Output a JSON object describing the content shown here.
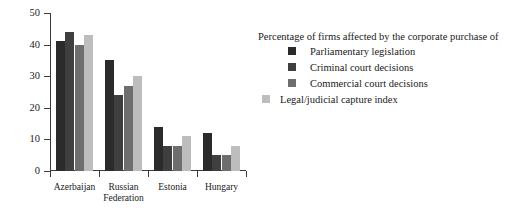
{
  "chart_data": {
    "type": "bar",
    "title": "",
    "subtitle": "",
    "xlabel": "",
    "ylabel": "",
    "ylim": [
      0,
      50
    ],
    "yticks": [
      0,
      10,
      20,
      30,
      40,
      50
    ],
    "grid": false,
    "legend_position": "right",
    "legend_title": "Percentage of firms affected by the corporate purchase of",
    "categories": [
      "Azerbaijan",
      "Russian\nFederation",
      "Estonia",
      "Hungary"
    ],
    "series": [
      {
        "name": "Parliamentary legislation",
        "color": "#2b2b2b",
        "values": [
          41,
          35,
          14,
          12
        ]
      },
      {
        "name": "Criminal court decisions",
        "color": "#3f3f3f",
        "values": [
          44,
          24,
          8,
          5
        ]
      },
      {
        "name": "Commercial court decisions",
        "color": "#6e6e6e",
        "values": [
          40,
          27,
          8,
          5
        ]
      },
      {
        "name": "Legal/judicial capture index",
        "color": "#bdbdbd",
        "values": [
          43,
          30,
          11,
          8
        ]
      }
    ]
  },
  "axis": {
    "ytick_labels": [
      "0",
      "10",
      "20",
      "30",
      "40",
      "50"
    ]
  },
  "colors": {
    "axis": "#3a3a3a",
    "text": "#1a1a1a",
    "background": "#ffffff"
  }
}
